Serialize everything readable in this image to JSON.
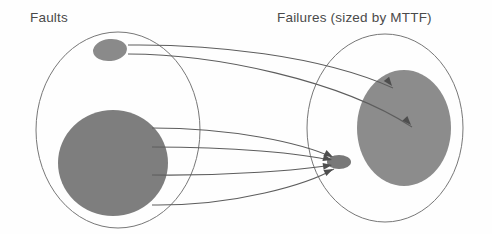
{
  "figure": {
    "background_color": "#fefefe",
    "width": 492,
    "height": 234
  },
  "sets": [
    {
      "id": "faults",
      "label": "Faults",
      "label_x": 30,
      "label_y": 22,
      "outline_color": "#777777",
      "center_x": 118,
      "center_y": 130,
      "radius_x": 82,
      "radius_y": 98
    },
    {
      "id": "failures",
      "label": "Failures (sized by MTTF)",
      "label_x": 277,
      "label_y": 22,
      "outline_color": "#777777",
      "center_x": 385,
      "center_y": 128,
      "radius_x": 78,
      "radius_y": 94
    }
  ],
  "blobs": [
    {
      "id": "fault-small",
      "set": "faults",
      "role": "small-fault",
      "fill": "#8a8a8a",
      "center_x": 110,
      "center_y": 50,
      "radius_x": 17,
      "radius_y": 11,
      "rotation": -6
    },
    {
      "id": "fault-large",
      "set": "faults",
      "role": "large-fault",
      "fill": "#7e7e7e",
      "center_x": 113,
      "center_y": 163,
      "radius_x": 55,
      "radius_y": 53,
      "rotation": 0
    },
    {
      "id": "failure-large",
      "set": "failures",
      "role": "large-failure",
      "fill": "#8c8c8c",
      "center_x": 404,
      "center_y": 128,
      "radius_x": 47,
      "radius_y": 58,
      "rotation": 0
    },
    {
      "id": "failure-small",
      "set": "failures",
      "role": "small-failure",
      "fill": "#787878",
      "center_x": 339,
      "center_y": 162,
      "radius_x": 12,
      "radius_y": 7,
      "rotation": 0
    }
  ],
  "mappings": [
    {
      "id": "m1",
      "from": "fault-small",
      "to": "failure-large",
      "path": "M 128 45 C 210 44 320 55 393 88",
      "arrow_x": 392,
      "arrow_y": 86,
      "arrow_angle": 52
    },
    {
      "id": "m2",
      "from": "fault-small",
      "to": "failure-large",
      "path": "M 128 54 C 214 54 340 80 412 127",
      "arrow_x": 411,
      "arrow_y": 125,
      "arrow_angle": 47
    },
    {
      "id": "m3",
      "from": "fault-large",
      "to": "failure-small",
      "path": "M 152 128 C 230 128 300 142 334 158",
      "arrow_x": 333,
      "arrow_y": 157,
      "arrow_angle": 27
    },
    {
      "id": "m4",
      "from": "fault-large",
      "to": "failure-small",
      "path": "M 152 147 C 232 147 302 153 333 161",
      "arrow_x": 332,
      "arrow_y": 160,
      "arrow_angle": 15
    },
    {
      "id": "m5",
      "from": "fault-large",
      "to": "failure-small",
      "path": "M 152 175 C 230 176 300 170 333 165",
      "arrow_x": 332,
      "arrow_y": 165,
      "arrow_angle": -9
    },
    {
      "id": "m6",
      "from": "fault-large",
      "to": "failure-small",
      "path": "M 152 205 C 236 206 308 184 334 169",
      "arrow_x": 333,
      "arrow_y": 169,
      "arrow_angle": -26
    }
  ],
  "colors": {
    "blob_gray": "#828282",
    "outline_gray": "#777777",
    "curve_gray": "#5d5d5d",
    "text_gray": "#4a4a4a",
    "background": "#fefefe"
  }
}
